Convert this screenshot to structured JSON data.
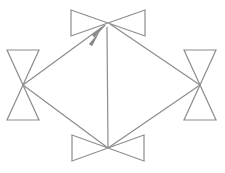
{
  "figure": {
    "title": "",
    "background_color": "#ffffff",
    "width": 225,
    "height": 173,
    "bottom_text_artifact": "",
    "stroke_color": "#8c8c8c",
    "arrow_color": "#8a8a8a",
    "stroke_width": 1.2
  },
  "diagram": {
    "type": "node-link-diagram",
    "layout": "diamond",
    "node_glyph": "bowtie",
    "nodes": [
      {
        "id": "top",
        "name": "top-bowtie",
        "orientation": "horizontal",
        "center_x": 108,
        "center_y": 23,
        "half_width": 37,
        "half_height": 13,
        "label": ""
      },
      {
        "id": "left",
        "name": "left-bowtie",
        "orientation": "vertical",
        "center_x": 23,
        "center_y": 85,
        "half_width": 16,
        "half_height": 35,
        "label": ""
      },
      {
        "id": "right",
        "name": "right-bowtie",
        "orientation": "vertical",
        "center_x": 200,
        "center_y": 85,
        "half_width": 16,
        "half_height": 35,
        "label": ""
      },
      {
        "id": "bottom",
        "name": "bottom-bowtie",
        "orientation": "horizontal",
        "center_x": 108,
        "center_y": 148,
        "half_width": 36,
        "half_height": 13,
        "label": ""
      }
    ],
    "edges": [
      {
        "id": "left-to-top",
        "name": "edge-left-to-top",
        "from": "left",
        "to": "top",
        "x1": 23,
        "y1": 85,
        "x2": 105,
        "y2": 25,
        "arrow": "end",
        "label": ""
      },
      {
        "id": "bottom-to-top",
        "name": "edge-bottom-to-top",
        "from": "bottom",
        "to": "top",
        "x1": 108,
        "y1": 148,
        "x2": 107,
        "y2": 27,
        "arrow": "end",
        "label": ""
      },
      {
        "id": "top-to-right",
        "name": "edge-top-to-right",
        "from": "top",
        "to": "right",
        "x1": 110,
        "y1": 24,
        "x2": 200,
        "y2": 85,
        "arrow": "none",
        "label": ""
      },
      {
        "id": "left-to-bottom",
        "name": "edge-left-to-bottom",
        "from": "left",
        "to": "bottom",
        "x1": 23,
        "y1": 85,
        "x2": 108,
        "y2": 148,
        "arrow": "none",
        "label": ""
      },
      {
        "id": "bottom-to-right",
        "name": "edge-bottom-to-right",
        "from": "bottom",
        "to": "right",
        "x1": 108,
        "y1": 148,
        "x2": 200,
        "y2": 85,
        "arrow": "none",
        "label": ""
      }
    ],
    "arrowheads": [
      {
        "id": "arrow-into-top-from-left",
        "name": "arrowhead-into-top-from-left",
        "tip_x": 106,
        "tip_y": 25,
        "angle_deg": -36
      },
      {
        "id": "arrow-into-top-from-bottom",
        "name": "arrowhead-into-top-from-bottom",
        "tip_x": 100,
        "tip_y": 31,
        "angle_deg": -52
      }
    ]
  }
}
